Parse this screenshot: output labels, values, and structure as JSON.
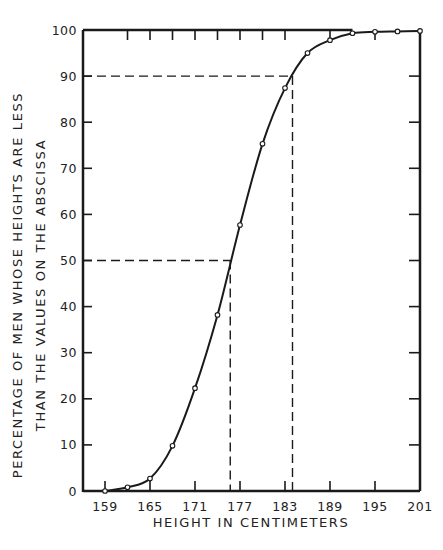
{
  "chart_data": {
    "type": "line",
    "title": "",
    "xlabel": "HEIGHT IN CENTIMETERS",
    "ylabel_line1": "PERCENTAGE OF MEN WHOSE HEIGHTS ARE LESS",
    "ylabel_line2": "THAN THE VALUES ON THE ABSCISSA",
    "xlim": [
      156,
      201
    ],
    "ylim": [
      0,
      100
    ],
    "x_ticks": [
      159,
      165,
      171,
      177,
      183,
      189,
      195,
      201
    ],
    "x_minor_ticks": [
      162,
      168,
      174,
      180,
      186,
      192,
      198
    ],
    "y_ticks": [
      0,
      10,
      20,
      30,
      40,
      50,
      60,
      70,
      80,
      90,
      100
    ],
    "grid": false,
    "legend": "none",
    "series": [
      {
        "name": "Cumulative percentage",
        "x": [
          159,
          162,
          165,
          168,
          171,
          174,
          177,
          180,
          183,
          186,
          189,
          192,
          195,
          198,
          201
        ],
        "values": [
          0,
          0.8,
          2.7,
          9.8,
          22.3,
          38.2,
          57.7,
          75.3,
          87.4,
          95.0,
          97.8,
          99.3,
          99.6,
          99.7,
          99.8
        ]
      }
    ],
    "annotations": [
      {
        "type": "dashed-guide",
        "y": 50,
        "x": 175.7,
        "label": "median"
      },
      {
        "type": "dashed-guide",
        "y": 90,
        "x": 184.0,
        "label": "90th percentile"
      }
    ]
  }
}
